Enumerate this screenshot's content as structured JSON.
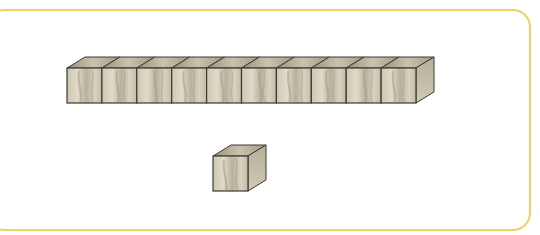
{
  "diagram": {
    "type": "base-ten-blocks",
    "frame_color": "#f2cf6a",
    "rod": {
      "label": "ten-rod",
      "cube_count": 10
    },
    "unit": {
      "label": "unit-cube",
      "cube_count": 1
    },
    "colors": {
      "front_face": "#cfc8b4",
      "top_face": "#a8a08c",
      "side_face": "#bdb59f",
      "edge": "#3a3a36",
      "grain": "#9c9380"
    }
  }
}
